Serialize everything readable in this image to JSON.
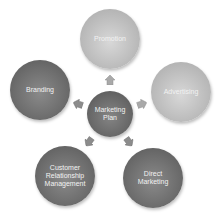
{
  "diagram": {
    "type": "radial-cycle",
    "center": {
      "label": "Marketing Plan"
    },
    "nodes": [
      {
        "id": "promotion",
        "label": "Promotion",
        "shade": "light"
      },
      {
        "id": "advertising",
        "label": "Advertising",
        "shade": "light"
      },
      {
        "id": "direct-marketing",
        "label": "Direct Marketing",
        "shade": "dark"
      },
      {
        "id": "crm",
        "label": "Customer Relationship Management",
        "shade": "dark"
      },
      {
        "id": "branding",
        "label": "Branding",
        "shade": "dark"
      }
    ],
    "colors": {
      "light_node": "#bdbdbd",
      "dark_node": "#6e6e6e",
      "arrow": "#a9a9a9",
      "text": "#f2f2f2"
    }
  }
}
